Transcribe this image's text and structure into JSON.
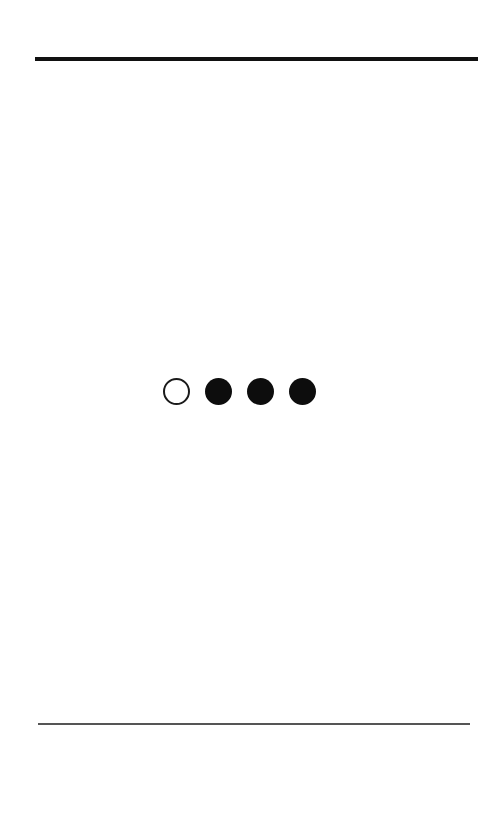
{
  "page": {
    "background_color": "#ffffff",
    "width": 478,
    "height": 824
  },
  "rules": {
    "top": {
      "name": "top-divider",
      "color": "#111111",
      "thickness": "4px"
    },
    "bottom": {
      "name": "bottom-divider",
      "color": "#555555",
      "thickness": "2px"
    }
  },
  "step_indicator": {
    "total": 4,
    "active_index": 0,
    "filled_color": "#0d0d0d",
    "hollow_border_color": "#1a1a1a",
    "dots": [
      {
        "state": "hollow",
        "label": "1"
      },
      {
        "state": "filled",
        "label": "2"
      },
      {
        "state": "filled",
        "label": "3"
      },
      {
        "state": "filled",
        "label": "4"
      }
    ]
  },
  "content": {
    "header_text": "",
    "body_text": "",
    "footer_text": ""
  }
}
